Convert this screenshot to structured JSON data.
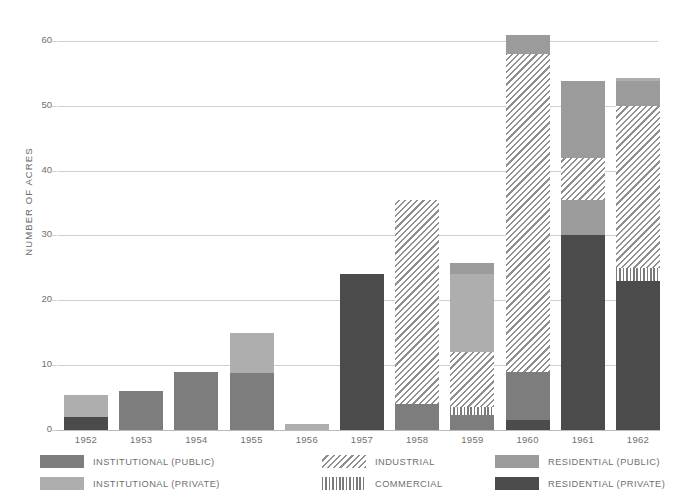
{
  "chart_data": {
    "type": "bar",
    "subtype": "stacked-bar",
    "title": "",
    "xlabel": "",
    "ylabel": "NUMBER OF ACRES",
    "ylim": [
      0,
      62
    ],
    "yticks": [
      0,
      10,
      20,
      30,
      40,
      50,
      60
    ],
    "ytick_labels": [
      "0",
      "10",
      "20",
      "30",
      "40",
      "50",
      "60"
    ],
    "grid": "horizontal",
    "legend_position": "bottom",
    "categories": [
      "1952",
      "1953",
      "1954",
      "1955",
      "1956",
      "1957",
      "1958",
      "1959",
      "1960",
      "1961",
      "1962"
    ],
    "series": [
      {
        "name": "INSTITUTIONAL (PUBLIC)",
        "key": "inst_pub",
        "color": "#7d7d7d",
        "fill": "solid",
        "values": [
          0,
          6.0,
          9.0,
          8.8,
          0,
          0,
          4.0,
          2.3,
          7.5,
          0,
          0
        ]
      },
      {
        "name": "INSTITUTIONAL (PRIVATE)",
        "key": "inst_priv",
        "color": "#aeaeae",
        "fill": "solid",
        "values": [
          3.4,
          0,
          0,
          6.2,
          1.0,
          0,
          0,
          12.0,
          0,
          0,
          0
        ]
      },
      {
        "name": "INDUSTRIAL",
        "key": "industrial",
        "color": "#8f8f8f",
        "fill": "diagonal-hatch",
        "values": [
          0,
          0,
          0,
          0,
          0,
          0,
          31.5,
          8.5,
          49.0,
          6.5,
          25.0
        ]
      },
      {
        "name": "COMMERCIAL",
        "key": "commercial",
        "color": "#7a7a7a",
        "fill": "vertical-hatch",
        "values": [
          0,
          0,
          0,
          0,
          0,
          0,
          0,
          1.2,
          0,
          0,
          2.0
        ]
      },
      {
        "name": "RESIDENTIAL (PUBLIC)",
        "key": "res_pub",
        "color": "#9b9b9b",
        "fill": "solid",
        "values": [
          0,
          0,
          0,
          0,
          0,
          0,
          0,
          1.7,
          3.0,
          17.3,
          4.3
        ]
      },
      {
        "name": "RESIDENTIAL (PRIVATE)",
        "key": "res_priv",
        "color": "#4b4b4b",
        "fill": "solid",
        "values": [
          2.0,
          0,
          0,
          0,
          0,
          24.0,
          0,
          0,
          1.5,
          30.0,
          23.0
        ]
      }
    ],
    "totals": [
      5.4,
      6.0,
      9.0,
      15.0,
      1.0,
      24.0,
      35.5,
      25.7,
      61.0,
      53.8,
      54.3
    ],
    "stacks": [
      {
        "year": "1952",
        "segments": [
          {
            "key": "res_priv",
            "from": 0,
            "to": 2.0
          },
          {
            "key": "inst_priv",
            "from": 2.0,
            "to": 5.4
          }
        ]
      },
      {
        "year": "1953",
        "segments": [
          {
            "key": "inst_pub",
            "from": 0,
            "to": 6.0
          }
        ]
      },
      {
        "year": "1954",
        "segments": [
          {
            "key": "inst_pub",
            "from": 0,
            "to": 9.0
          }
        ]
      },
      {
        "year": "1955",
        "segments": [
          {
            "key": "inst_pub",
            "from": 0,
            "to": 8.8
          },
          {
            "key": "inst_priv",
            "from": 8.8,
            "to": 15.0
          }
        ]
      },
      {
        "year": "1956",
        "segments": [
          {
            "key": "inst_priv",
            "from": 0,
            "to": 1.0
          }
        ]
      },
      {
        "year": "1957",
        "segments": [
          {
            "key": "res_priv",
            "from": 0,
            "to": 24.0
          }
        ]
      },
      {
        "year": "1958",
        "segments": [
          {
            "key": "inst_pub",
            "from": 0,
            "to": 4.0
          },
          {
            "key": "industrial",
            "from": 4.0,
            "to": 35.5
          }
        ]
      },
      {
        "year": "1959",
        "segments": [
          {
            "key": "inst_pub",
            "from": 0,
            "to": 2.3
          },
          {
            "key": "commercial",
            "from": 2.3,
            "to": 3.5
          },
          {
            "key": "industrial",
            "from": 3.5,
            "to": 12.0
          },
          {
            "key": "inst_priv",
            "from": 12.0,
            "to": 24.0
          },
          {
            "key": "res_pub",
            "from": 24.0,
            "to": 25.7
          }
        ]
      },
      {
        "year": "1960",
        "segments": [
          {
            "key": "res_priv",
            "from": 0,
            "to": 1.5
          },
          {
            "key": "inst_pub",
            "from": 1.5,
            "to": 9.0
          },
          {
            "key": "industrial",
            "from": 9.0,
            "to": 58.0
          },
          {
            "key": "res_pub",
            "from": 58.0,
            "to": 61.0
          }
        ]
      },
      {
        "year": "1961",
        "segments": [
          {
            "key": "res_priv",
            "from": 0,
            "to": 30.0
          },
          {
            "key": "res_pub",
            "from": 30.0,
            "to": 35.5
          },
          {
            "key": "industrial",
            "from": 35.5,
            "to": 42.0
          },
          {
            "key": "res_pub",
            "from": 42.0,
            "to": 53.8
          }
        ]
      },
      {
        "year": "1962",
        "segments": [
          {
            "key": "res_priv",
            "from": 0,
            "to": 23.0
          },
          {
            "key": "commercial",
            "from": 23.0,
            "to": 25.0
          },
          {
            "key": "industrial",
            "from": 25.0,
            "to": 50.0
          },
          {
            "key": "res_pub",
            "from": 50.0,
            "to": 53.8
          },
          {
            "key": "inst_priv",
            "from": 53.8,
            "to": 54.3
          }
        ]
      }
    ]
  },
  "axis": {
    "ylabel": "NUMBER OF ACRES",
    "ticks": [
      "60",
      "50",
      "40",
      "30",
      "20",
      "10",
      "0"
    ]
  },
  "legend": {
    "columns": [
      {
        "items": [
          {
            "label": "INSTITUTIONAL (PUBLIC)",
            "key": "inst_pub"
          },
          {
            "label": "INSTITUTIONAL (PRIVATE)",
            "key": "inst_priv"
          }
        ]
      },
      {
        "items": [
          {
            "label": "INDUSTRIAL",
            "key": "industrial"
          },
          {
            "label": "COMMERCIAL",
            "key": "commercial"
          }
        ]
      },
      {
        "items": [
          {
            "label": "RESIDENTIAL (PUBLIC)",
            "key": "res_pub"
          },
          {
            "label": "RESIDENTIAL (PRIVATE)",
            "key": "res_priv"
          }
        ]
      }
    ]
  }
}
